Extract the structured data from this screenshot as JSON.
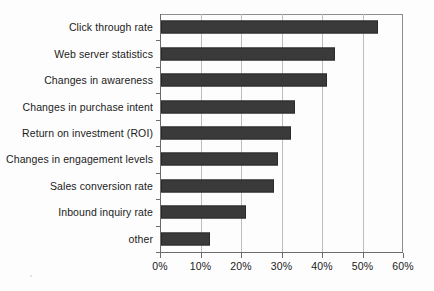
{
  "chart_data": {
    "type": "bar",
    "orientation": "horizontal",
    "title": "",
    "xlabel": "",
    "ylabel": "",
    "xlim": [
      0,
      60
    ],
    "grid": true,
    "legend": false,
    "xticks": [
      "0%",
      "10%",
      "20%",
      "30%",
      "40%",
      "50%",
      "60%"
    ],
    "xtick_values": [
      0,
      10,
      20,
      30,
      40,
      50,
      60
    ],
    "categories": [
      "Click through rate",
      "Web server statistics",
      "Changes in awareness",
      "Changes in purchase intent",
      "Return on investment (ROI)",
      "Changes in engagement levels",
      "Sales conversion rate",
      "Inbound inquiry rate",
      "other"
    ],
    "values": [
      53.5,
      43,
      41,
      33,
      32,
      29,
      28,
      21,
      12
    ],
    "value_unit": "%",
    "bar_color": "#3a3a3a",
    "grid_color": "#bdbdbd",
    "axis_color": "#6b6b6b",
    "background_color": "#fdfdfd"
  }
}
